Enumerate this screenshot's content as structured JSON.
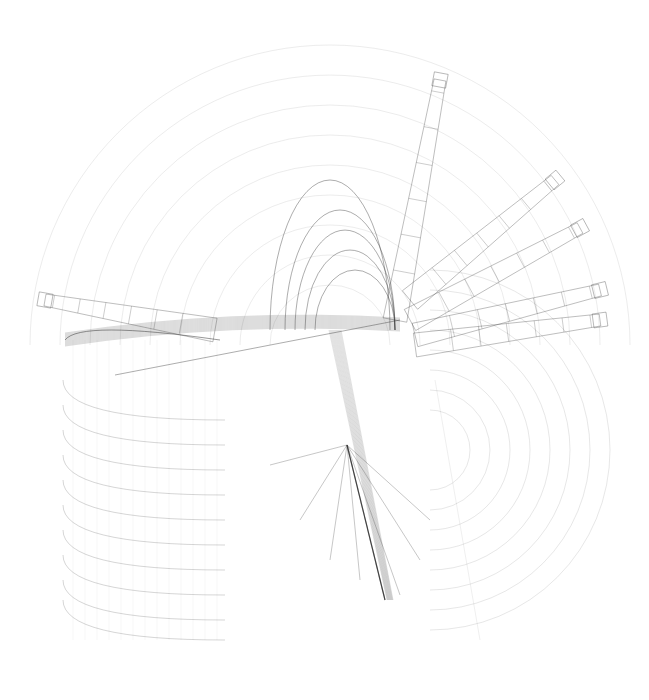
{
  "artwork": {
    "title": "",
    "background": "#ffffff",
    "stroke": "#333333",
    "faint_stroke": "#bbbbbb",
    "width": 649,
    "height": 700
  },
  "concentric_arcs": {
    "cx": 330,
    "cy": 345,
    "radii": [
      60,
      90,
      120,
      150,
      180,
      210,
      240,
      270,
      300
    ],
    "opacity": 0.12
  },
  "right_arcs": {
    "cx": 430,
    "cy": 450,
    "radii": [
      40,
      60,
      80,
      100,
      120,
      140,
      160,
      180
    ],
    "opacity": 0.15
  },
  "left_stack": {
    "x0": 63,
    "x1": 225,
    "ys": [
      420,
      445,
      470,
      495,
      520,
      545,
      570,
      595,
      620,
      640
    ],
    "opacity": 0.25
  },
  "beams": [
    {
      "x1": 395,
      "y1": 320,
      "x2": 440,
      "y2": 80
    },
    {
      "x1": 410,
      "y1": 300,
      "x2": 555,
      "y2": 180
    },
    {
      "x1": 410,
      "y1": 320,
      "x2": 580,
      "y2": 228
    },
    {
      "x1": 415,
      "y1": 335,
      "x2": 600,
      "y2": 290
    },
    {
      "x1": 415,
      "y1": 345,
      "x2": 600,
      "y2": 320
    },
    {
      "x1": 215,
      "y1": 330,
      "x2": 45,
      "y2": 300
    }
  ],
  "domes": [
    {
      "cx": 330,
      "cy": 330,
      "rx": 60,
      "ry": 150
    },
    {
      "cx": 340,
      "cy": 330,
      "rx": 55,
      "ry": 120
    },
    {
      "cx": 345,
      "cy": 330,
      "rx": 50,
      "ry": 100
    },
    {
      "cx": 350,
      "cy": 330,
      "rx": 45,
      "ry": 80
    },
    {
      "cx": 355,
      "cy": 330,
      "rx": 40,
      "ry": 60
    }
  ],
  "horizontal_band": {
    "x0": 65,
    "x1": 400,
    "y": 335,
    "count": 14,
    "spread": 14
  },
  "fan": {
    "apex": [
      347,
      445
    ],
    "targets": [
      [
        270,
        465
      ],
      [
        300,
        520
      ],
      [
        330,
        560
      ],
      [
        360,
        580
      ],
      [
        385,
        600
      ],
      [
        400,
        595
      ],
      [
        420,
        560
      ],
      [
        430,
        520
      ]
    ]
  },
  "column": {
    "x_top": 335,
    "y_top": 330,
    "x_bot": 390,
    "y_bot": 600
  }
}
